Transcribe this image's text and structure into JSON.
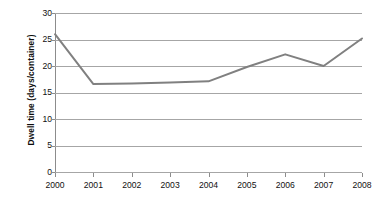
{
  "chart_data": {
    "type": "line",
    "title": "",
    "subtitle": "",
    "xlabel": "",
    "ylabel": "Dwell time (days/container)",
    "categories": [
      "2000",
      "2001",
      "2002",
      "2003",
      "2004",
      "2005",
      "2006",
      "2007",
      "2008"
    ],
    "x": [
      2000,
      2001,
      2002,
      2003,
      2004,
      2005,
      2006,
      2007,
      2008
    ],
    "values": [
      26.0,
      16.6,
      16.7,
      16.9,
      17.1,
      19.8,
      22.2,
      20.0,
      25.2
    ],
    "series": [
      {
        "name": "Dwell time",
        "values": [
          26.0,
          16.6,
          16.7,
          16.9,
          17.1,
          19.8,
          22.2,
          20.0,
          25.2
        ],
        "color": "#808080"
      }
    ],
    "ylim": [
      0,
      30
    ],
    "yticks": [
      0,
      5,
      10,
      15,
      20,
      25,
      30
    ],
    "ytick_labels": [
      "0",
      "5",
      "10",
      "15",
      "20",
      "25",
      "30"
    ],
    "xtick_labels": [
      "2000",
      "2001",
      "2002",
      "2003",
      "2004",
      "2005",
      "2006",
      "2007",
      "2008"
    ],
    "grid": {
      "horizontal": true,
      "vertical": false,
      "color": "#a6a6a6"
    },
    "legend": {
      "visible": false,
      "position": "none",
      "entries": []
    },
    "annotations": [],
    "markers": false,
    "background_color": "#ffffff",
    "axis_color": "#8c8c8c",
    "line_color": "#808080",
    "line_width": 2
  }
}
